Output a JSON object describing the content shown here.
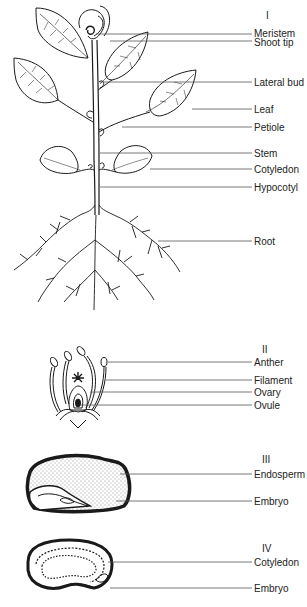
{
  "panels": [
    {
      "id": "I",
      "numeral": "I",
      "title": "Plant",
      "labels": [
        "Meristem",
        "Shoot tip",
        "Lateral bud",
        "Leaf",
        "Petiole",
        "Stem",
        "Cotyledon",
        "Hypocotyl",
        "Root"
      ]
    },
    {
      "id": "II",
      "numeral": "II",
      "title": "Flower",
      "labels": [
        "Anther",
        "Filament",
        "Ovary",
        "Ovule"
      ]
    },
    {
      "id": "III",
      "numeral": "III",
      "title": "Seed with endosperm",
      "labels": [
        "Endosperm",
        "Embryo"
      ]
    },
    {
      "id": "IV",
      "numeral": "IV",
      "title": "Seed without endosperm",
      "labels": [
        "Cotyledon",
        "Embryo"
      ]
    }
  ],
  "colors": {
    "ink": "#1a1a1a",
    "leader": "#555555",
    "background": "#ffffff"
  }
}
